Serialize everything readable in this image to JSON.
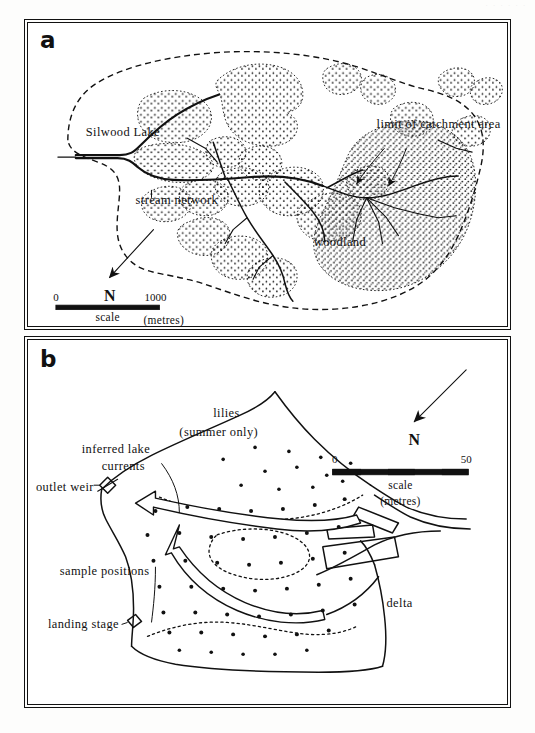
{
  "figure": {
    "scan_artifact": ". . .  .  .  ."
  },
  "panel_a": {
    "label": "a",
    "labels": {
      "lake": "Silwood Lake",
      "stream_network": "stream network",
      "catchment": "limit of catchment area",
      "woodland": "woodland"
    },
    "north": "N",
    "scale": {
      "min": "0",
      "max": "1000",
      "caption": "scale",
      "units": "(metres)"
    }
  },
  "panel_b": {
    "label": "b",
    "labels": {
      "lilies": "lilies",
      "lilies_note": "(summer only)",
      "currents_line1": "inferred lake",
      "currents_line2": "currents",
      "outlet_weir": "outlet weir",
      "sample_positions": "sample positions",
      "landing_stage": "landing stage",
      "delta": "delta"
    },
    "north": "N",
    "scale": {
      "min": "0",
      "max": "50",
      "caption": "scale",
      "units": "(metres)"
    }
  },
  "colors": {
    "ink": "#111111",
    "paper": "#ffffff"
  }
}
